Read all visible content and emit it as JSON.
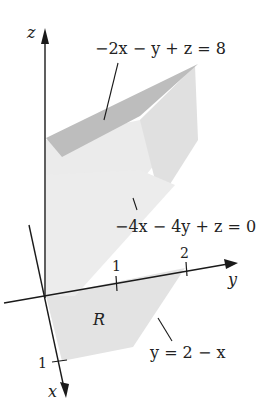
{
  "figure": {
    "type": "3d-solid-region-diagram",
    "axes": {
      "z_label": "z",
      "y_label": "y",
      "x_label": "x",
      "y_ticks": [
        "1",
        "2"
      ],
      "x_ticks": [
        "1"
      ]
    },
    "surfaces": {
      "top_plane": "−2x − y + z = 8",
      "bottom_plane": "−4x − 4y + z = 0"
    },
    "region": {
      "label": "R",
      "boundary_label": "y = 2 − x"
    },
    "colors": {
      "top_face": "#b9b9b9",
      "side_face": "#e6e6e6",
      "side_face_dark": "#d8d8d8",
      "region_fill": "#e3e3e3",
      "axis": "#1a1a1a"
    }
  }
}
